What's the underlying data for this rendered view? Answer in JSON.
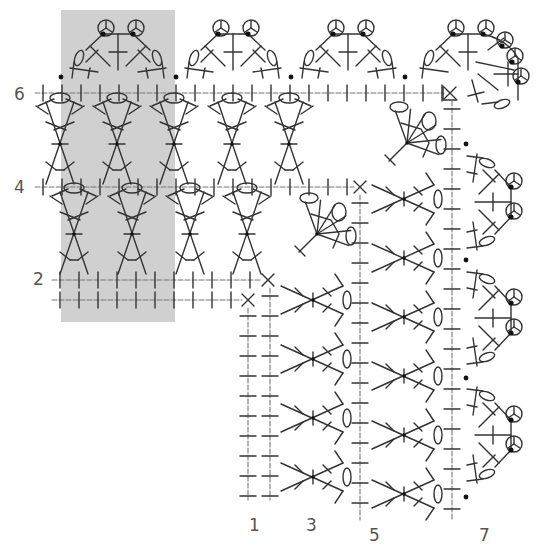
{
  "diagram": {
    "type": "crochet-chart",
    "colors": {
      "shade": "#d0d0d0",
      "stroke": "#333333",
      "label": "#555555",
      "background": "#ffffff"
    },
    "repeat_highlight": {
      "x": 61,
      "y": 10,
      "w": 114,
      "h": 312
    },
    "row_labels": [
      {
        "text": "6",
        "x": 14,
        "y": 86
      },
      {
        "text": "4",
        "x": 14,
        "y": 179
      },
      {
        "text": "2",
        "x": 33,
        "y": 271
      }
    ],
    "column_labels": [
      {
        "text": "1",
        "x": 249,
        "y": 517
      },
      {
        "text": "3",
        "x": 306,
        "y": 517
      },
      {
        "text": "5",
        "x": 369,
        "y": 527
      },
      {
        "text": "7",
        "x": 479,
        "y": 527
      }
    ],
    "horizontal_rows": [
      {
        "row": 1,
        "y": 300,
        "x1": 52,
        "x2": 248,
        "step": 19,
        "end": "x"
      },
      {
        "row": 2,
        "y": 280,
        "x1": 52,
        "x2": 268,
        "step": 19,
        "end": "x"
      },
      {
        "row": 4,
        "y": 187,
        "x1": 35,
        "x2": 360,
        "step": 19,
        "end": "x"
      },
      {
        "row": 6,
        "y": 93,
        "x1": 35,
        "x2": 450,
        "step": 19,
        "end": "x-box"
      }
    ],
    "vertical_rows": [
      {
        "row": 1,
        "x": 248,
        "y1": 300,
        "y2": 500,
        "step": 20
      },
      {
        "row": 3,
        "x": 270,
        "y1": 280,
        "y2": 500,
        "step": 20
      },
      {
        "row": 5,
        "x": 360,
        "y1": 187,
        "y2": 520,
        "step": 20
      },
      {
        "row": 7,
        "x": 452,
        "y1": 93,
        "y2": 520,
        "step": 20
      }
    ],
    "row3_clusters": [
      {
        "cx": 74,
        "cy": 234
      },
      {
        "cx": 132,
        "cy": 234
      },
      {
        "cx": 190,
        "cy": 234
      },
      {
        "cx": 247,
        "cy": 234
      }
    ],
    "row5_clusters": [
      {
        "cx": 60,
        "cy": 144
      },
      {
        "cx": 117,
        "cy": 144
      },
      {
        "cx": 174,
        "cy": 144
      },
      {
        "cx": 232,
        "cy": 144
      },
      {
        "cx": 289,
        "cy": 144
      }
    ],
    "row3_side_clusters": [
      {
        "cx": 313,
        "cy": 300
      },
      {
        "cx": 313,
        "cy": 359
      },
      {
        "cx": 313,
        "cy": 418
      },
      {
        "cx": 313,
        "cy": 477
      }
    ],
    "row5_side_clusters": [
      {
        "cx": 404,
        "cy": 199
      },
      {
        "cx": 404,
        "cy": 258
      },
      {
        "cx": 404,
        "cy": 317
      },
      {
        "cx": 404,
        "cy": 376
      },
      {
        "cx": 404,
        "cy": 435
      },
      {
        "cx": 404,
        "cy": 494
      }
    ],
    "corner_fans": [
      {
        "cx": 317,
        "cy": 234
      },
      {
        "cx": 407,
        "cy": 143
      }
    ],
    "row7_top_shells": [
      {
        "cx": 118,
        "cy": 60
      },
      {
        "cx": 233,
        "cy": 60
      },
      {
        "cx": 348,
        "cy": 60
      }
    ],
    "row7_side_shells": [
      {
        "cx": 485,
        "cy": 202
      },
      {
        "cx": 485,
        "cy": 318
      },
      {
        "cx": 485,
        "cy": 435
      }
    ],
    "row7_corner_shell": {
      "cx": 468,
      "cy": 60
    },
    "row7_dots": [
      {
        "x": 61,
        "y": 77
      },
      {
        "x": 176,
        "y": 77
      },
      {
        "x": 291,
        "y": 77
      },
      {
        "x": 405,
        "y": 77
      },
      {
        "x": 466,
        "y": 144
      },
      {
        "x": 466,
        "y": 260
      },
      {
        "x": 466,
        "y": 378
      },
      {
        "x": 466,
        "y": 497
      }
    ]
  }
}
